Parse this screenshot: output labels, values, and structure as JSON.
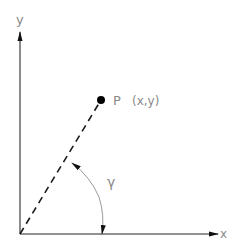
{
  "diagram": {
    "axes": {
      "x_label": "x",
      "y_label": "y"
    },
    "point": {
      "label": "P",
      "coords_label": "(x,y)"
    },
    "angle": {
      "label": "γ"
    },
    "colors": {
      "axis": "#6e6e6e",
      "text": "#8a8a8a",
      "point": "#000000",
      "dashed_line": "#1a1a1a",
      "arc": "#9a9a9a"
    }
  }
}
